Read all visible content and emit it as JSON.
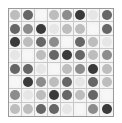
{
  "grid": {
    "rows": 8,
    "cols": 8,
    "shades": {
      "0": "#f7f7f7",
      "1": "#e6e6e6",
      "2": "#bdbdbd",
      "3": "#8c8c8c",
      "4": "#666666",
      "5": "#3a3a3a"
    },
    "cells": [
      [
        2,
        4,
        0,
        2,
        3,
        5,
        1,
        4
      ],
      [
        4,
        3,
        5,
        1,
        2,
        2,
        0,
        4
      ],
      [
        5,
        2,
        4,
        3,
        0,
        4,
        2,
        1
      ],
      [
        1,
        0,
        2,
        4,
        5,
        4,
        2,
        3
      ],
      [
        4,
        4,
        1,
        0,
        2,
        3,
        5,
        2
      ],
      [
        0,
        5,
        3,
        2,
        4,
        1,
        4,
        2
      ],
      [
        3,
        1,
        2,
        5,
        4,
        2,
        4,
        0
      ],
      [
        2,
        2,
        4,
        4,
        1,
        0,
        3,
        5
      ]
    ]
  }
}
